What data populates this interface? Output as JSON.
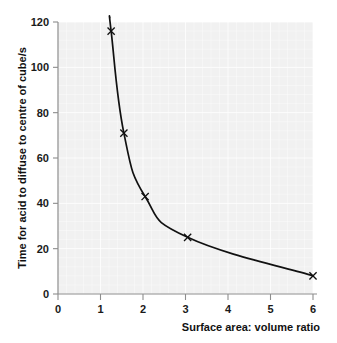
{
  "chart_data": {
    "type": "line",
    "title": "",
    "subtitle": "",
    "xlabel": "Surface area: volume ratio",
    "ylabel": "Time for acid to diffuse to centre of cube/s",
    "xlim": [
      0,
      6
    ],
    "ylim": [
      0,
      120
    ],
    "xticks": [
      0,
      1,
      2,
      3,
      4,
      5,
      6
    ],
    "yticks": [
      0,
      20,
      40,
      60,
      80,
      100,
      120
    ],
    "xtick_labels": [
      "0",
      "1",
      "2",
      "3",
      "4",
      "5",
      "6"
    ],
    "ytick_labels": [
      "0",
      "20",
      "40",
      "60",
      "80",
      "100",
      "120"
    ],
    "grid": true,
    "legend": false,
    "marker": "x",
    "series": [
      {
        "name": "Time for acid to diffuse to centre of cube",
        "x": [
          1.25,
          1.55,
          2.05,
          3.05,
          6.0
        ],
        "y": [
          116,
          71,
          43,
          25,
          8
        ]
      }
    ],
    "points": [
      {
        "x": 1.25,
        "y": 116
      },
      {
        "x": 1.55,
        "y": 71
      },
      {
        "x": 2.05,
        "y": 43
      },
      {
        "x": 3.05,
        "y": 25
      },
      {
        "x": 6.0,
        "y": 8
      }
    ],
    "curve_shape": "smooth-decreasing-hyperbolic",
    "colors": {
      "plot_background": "#f1f1f1",
      "page_background": "#ffffff",
      "curve": "#111111",
      "marker": "#111111",
      "axis": "#8d8d8d",
      "grid": "#ffffff",
      "text": "#111111"
    }
  },
  "axes": {
    "x_title": "Surface area: volume ratio",
    "y_title": "Time for acid to diffuse to centre of cube/s"
  }
}
